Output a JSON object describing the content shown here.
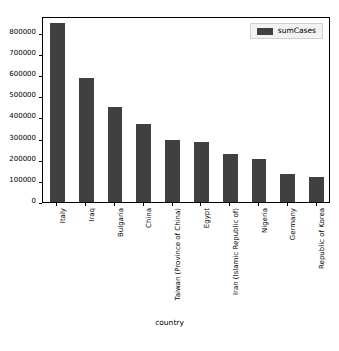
{
  "chart_data": {
    "type": "bar",
    "title": "",
    "xlabel": "country",
    "ylabel": "",
    "grid": false,
    "legend_position": "upper right",
    "categories": [
      "Italy",
      "Iraq",
      "Bulgaria",
      "China",
      "Taiwan (Province of China)",
      "Egypt",
      "Iran (Islamic Republic of)",
      "Nigeria",
      "Germany",
      "Republic of Korea"
    ],
    "series": [
      {
        "name": "sumCases",
        "color": "#404040",
        "values": [
          845000,
          588000,
          450000,
          368000,
          295000,
          283000,
          227000,
          203000,
          133000,
          117000
        ]
      }
    ],
    "ylim": [
      0,
      880000
    ],
    "yticks": [
      0,
      100000,
      200000,
      300000,
      400000,
      500000,
      600000,
      700000,
      800000
    ],
    "ytick_labels": [
      "0",
      "100000",
      "200000",
      "300000",
      "400000",
      "500000",
      "600000",
      "700000",
      "800000"
    ]
  },
  "legend": {
    "entries": [
      {
        "label": "sumCases",
        "color": "#404040"
      }
    ]
  },
  "axis": {
    "x_title": "country"
  }
}
